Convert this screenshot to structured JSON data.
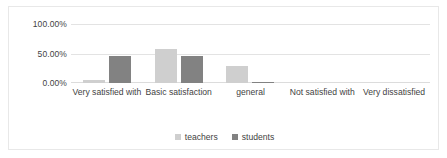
{
  "chart_data": {
    "type": "bar",
    "title": "",
    "subtitle": "",
    "xlabel": "",
    "ylabel": "",
    "categories": [
      "Very satisfied with",
      "Basic satisfaction",
      "general",
      "Not satisfied with",
      "Very dissatisfied"
    ],
    "series": [
      {
        "name": "teachers",
        "color": "#cfcfcf",
        "values": [
          5,
          58,
          28,
          0,
          0
        ]
      },
      {
        "name": "students",
        "color": "#828282",
        "values": [
          46,
          46,
          2,
          0,
          0
        ]
      }
    ],
    "ylim": [
      0,
      100
    ],
    "yticks": [
      0,
      50,
      100
    ],
    "ytick_labels": [
      "0.00%",
      "50.00%",
      "100.00%"
    ],
    "grid": true,
    "legend_position": "bottom",
    "value_suffix": "%"
  },
  "legend": {
    "entries": [
      {
        "label": "teachers"
      },
      {
        "label": "students"
      }
    ]
  },
  "colors": {
    "teachers": "#cfcfcf",
    "students": "#828282",
    "gridline": "#e3e3e3",
    "frame": "#e8e8e8",
    "text": "#3f3f3f"
  }
}
